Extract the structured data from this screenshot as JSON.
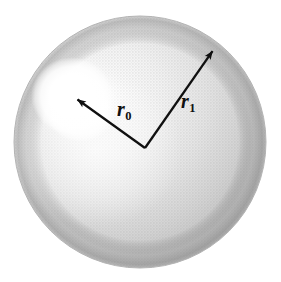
{
  "figure": {
    "caption": "",
    "background_color": "#ffffff",
    "width": 281,
    "height": 282
  },
  "sphere": {
    "name": "shaded-sphere",
    "center_x": 140,
    "center_y": 142,
    "radius": 126,
    "edge_color": "#a9a9a9",
    "body_color": "#d6d6d6",
    "highlight_color": "#ffffff",
    "highlight_center_x": 72,
    "highlight_center_y": 96,
    "highlight_radius": 40
  },
  "vectors": [
    {
      "name": "vector-r0",
      "label_base": "r",
      "label_sub": "0",
      "label_full": "r₀",
      "from_x": 145,
      "from_y": 148,
      "to_x": 74,
      "to_y": 97,
      "color": "#101010",
      "label_x": 117,
      "label_y": 99
    },
    {
      "name": "vector-r1",
      "label_base": "r",
      "label_sub": "1",
      "label_full": "r₁",
      "from_x": 145,
      "from_y": 148,
      "to_x": 216,
      "to_y": 46,
      "color": "#101010",
      "label_x": 181,
      "label_y": 91
    }
  ]
}
